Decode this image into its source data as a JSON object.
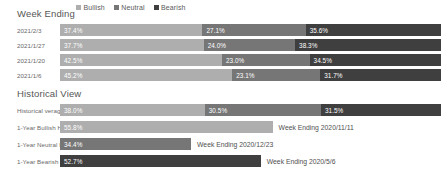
{
  "colors": {
    "bullish": "#aeaeae",
    "neutral": "#767676",
    "bearish": "#3f3f3f",
    "text_dark": "#565656",
    "text_label": "#6a6a6a",
    "value_text": "#ffffff",
    "background": "#ffffff"
  },
  "legend": {
    "items": [
      {
        "label": "Bullish",
        "color": "#aeaeae",
        "swatch": "legend-swatch-bullish"
      },
      {
        "label": "Neutral",
        "color": "#767676",
        "swatch": "legend-swatch-neutral"
      },
      {
        "label": "Bearish",
        "color": "#3f3f3f",
        "swatch": "legend-swatch-bearish"
      }
    ]
  },
  "sections": {
    "week_ending": {
      "title": "Week Ending"
    },
    "historical": {
      "title": "Historical View"
    }
  },
  "week_rows": [
    {
      "label": "2021/2/3",
      "bullish": "37.4%",
      "neutral": "27.1%",
      "bearish": "35.6%",
      "bullish_v": 37.4,
      "neutral_v": 27.1,
      "bearish_v": 35.6
    },
    {
      "label": "2021/1/27",
      "bullish": "37.7%",
      "neutral": "24.0%",
      "bearish": "38.3%",
      "bullish_v": 37.7,
      "neutral_v": 24.0,
      "bearish_v": 38.3
    },
    {
      "label": "2021/1/20",
      "bullish": "42.5%",
      "neutral": "23.0%",
      "bearish": "34.5%",
      "bullish_v": 42.5,
      "neutral_v": 23.0,
      "bearish_v": 34.5
    },
    {
      "label": "2021/1/6",
      "bullish": "45.2%",
      "neutral": "23.1%",
      "bearish": "31.7%",
      "bullish_v": 45.2,
      "neutral_v": 23.1,
      "bearish_v": 31.7
    }
  ],
  "historical_rows": [
    {
      "label": "Historical verages",
      "type": "stacked",
      "bullish": "38.0%",
      "neutral": "30.5%",
      "bearish": "31.5%",
      "bullish_v": 38.0,
      "neutral_v": 30.5,
      "bearish_v": 31.5,
      "annotation": ""
    },
    {
      "label": "1-Year Bullish High",
      "type": "single",
      "value": "55.8%",
      "value_v": 55.8,
      "series": "bullish",
      "annotation": "Week Ending 2020/11/11"
    },
    {
      "label": "1-Year Neutral High",
      "type": "single",
      "value": "34.4%",
      "value_v": 34.4,
      "series": "neutral",
      "annotation": "Week Ending 2020/12/23"
    },
    {
      "label": "1-Year Bearish High",
      "type": "single",
      "value": "52.7%",
      "value_v": 52.7,
      "series": "bearish",
      "annotation": "Week Ending 2020/5/6"
    }
  ],
  "chart_data": {
    "type": "bar",
    "title": "Week Ending",
    "subtitle": "Historical View",
    "orientation": "horizontal",
    "stacked": true,
    "xlabel": "",
    "ylabel": "",
    "xlim": [
      0,
      100
    ],
    "grid": false,
    "legend_position": "top",
    "legend_entries": [
      "Bullish",
      "Neutral",
      "Bearish"
    ],
    "categories": [
      "2021/2/3",
      "2021/1/27",
      "2021/1/20",
      "2021/1/6"
    ],
    "series": [
      {
        "name": "Bullish",
        "values": [
          37.4,
          37.7,
          42.5,
          45.2
        ],
        "color": "#aeaeae"
      },
      {
        "name": "Neutral",
        "values": [
          27.1,
          24.0,
          23.0,
          23.1
        ],
        "color": "#767676"
      },
      {
        "name": "Bearish",
        "values": [
          35.6,
          38.3,
          34.5,
          31.7
        ],
        "color": "#3f3f3f"
      }
    ],
    "secondary_panel": {
      "title": "Historical View",
      "categories": [
        "Historical verages",
        "1-Year Bullish High",
        "1-Year Neutral High",
        "1-Year Bearish High"
      ],
      "rows": [
        {
          "category": "Historical verages",
          "bullish": 38.0,
          "neutral": 30.5,
          "bearish": 31.5
        },
        {
          "category": "1-Year Bullish High",
          "value": 55.8,
          "series": "Bullish",
          "annotation": "Week Ending 2020/11/11"
        },
        {
          "category": "1-Year Neutral High",
          "value": 34.4,
          "series": "Neutral",
          "annotation": "Week Ending 2020/12/23"
        },
        {
          "category": "1-Year Bearish High",
          "value": 52.7,
          "series": "Bearish",
          "annotation": "Week Ending 2020/5/6"
        }
      ]
    }
  }
}
